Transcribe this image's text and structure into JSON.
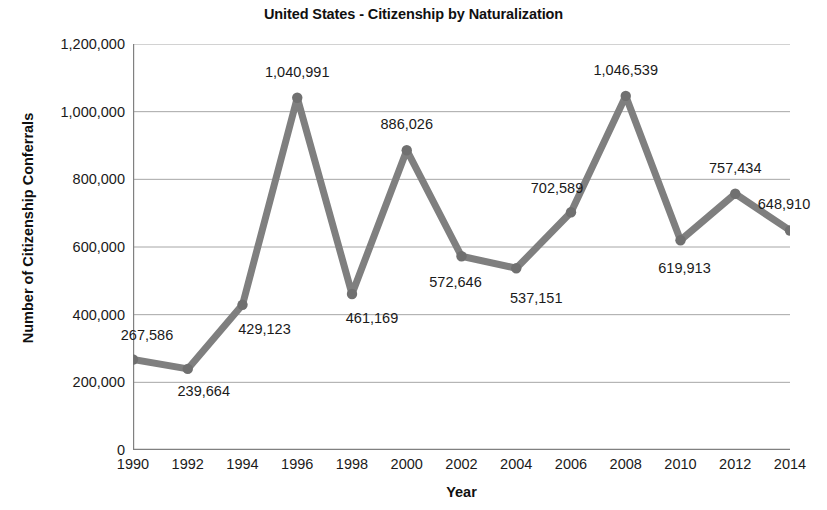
{
  "chart_data": {
    "type": "line",
    "title": "United States - Citizenship by Naturalization",
    "xlabel": "Year",
    "ylabel": "Number of Citizenship Conferrals",
    "categories": [
      "1990",
      "1992",
      "1994",
      "1996",
      "1998",
      "2000",
      "2002",
      "2004",
      "2006",
      "2008",
      "2010",
      "2012",
      "2014"
    ],
    "values": [
      267586,
      239664,
      429123,
      1040991,
      461169,
      886026,
      572646,
      537151,
      702589,
      1046539,
      619913,
      757434,
      648910
    ],
    "point_labels": [
      "267,586",
      "239,664",
      "429,123",
      "1,040,991",
      "461,169",
      "886,026",
      "572,646",
      "537,151",
      "702,589",
      "1,046,539",
      "619,913",
      "757,434",
      "648,910"
    ],
    "ylim": [
      0,
      1200000
    ],
    "ytick_values": [
      0,
      200000,
      400000,
      600000,
      800000,
      1000000,
      1200000
    ],
    "ytick_labels": [
      "0",
      "200,000",
      "400,000",
      "600,000",
      "800,000",
      "1,000,000",
      "1,200,000"
    ],
    "grid": true,
    "legend": "none",
    "series_color": "#7f7f7f",
    "marker_color": "#707070",
    "grid_color": "#a6a6a6",
    "axis_color": "#808080",
    "label_offsets": [
      {
        "dx": 14,
        "dy": -24
      },
      {
        "dx": 16,
        "dy": 22
      },
      {
        "dx": 22,
        "dy": 24
      },
      {
        "dx": 0,
        "dy": -26
      },
      {
        "dx": 20,
        "dy": 24
      },
      {
        "dx": 0,
        "dy": -26
      },
      {
        "dx": -6,
        "dy": 26
      },
      {
        "dx": 20,
        "dy": 30
      },
      {
        "dx": -14,
        "dy": -24
      },
      {
        "dx": 0,
        "dy": -26
      },
      {
        "dx": 4,
        "dy": 28
      },
      {
        "dx": 0,
        "dy": -26
      },
      {
        "dx": -6,
        "dy": -26
      }
    ]
  }
}
